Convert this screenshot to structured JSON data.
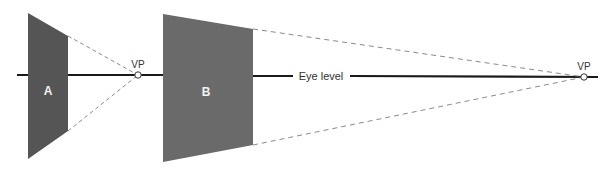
{
  "diagram": {
    "colors": {
      "background": "#ffffff",
      "plane_a": "#555555",
      "plane_b": "#6a6a6a",
      "eye_level_line": "#1a1a1a",
      "dashed_lines": "#8a8a8a",
      "vp_marker_fill": "#ffffff",
      "vp_marker_stroke": "#333333",
      "plane_label": "#f2f2f2",
      "text": "#333333"
    },
    "eye_level": {
      "label": "Eye level",
      "y": 75
    },
    "planes": [
      {
        "id": "A",
        "label": "A",
        "points": [
          [
            28,
            13
          ],
          [
            68,
            36
          ],
          [
            68,
            131
          ],
          [
            28,
            159
          ]
        ]
      },
      {
        "id": "B",
        "label": "B",
        "points": [
          [
            163,
            14
          ],
          [
            253,
            29
          ],
          [
            253,
            145
          ],
          [
            163,
            162
          ]
        ]
      }
    ],
    "vanishing_points": [
      {
        "label": "VP",
        "x": 138,
        "y": 75
      },
      {
        "label": "VP",
        "x": 584,
        "y": 77
      }
    ]
  }
}
